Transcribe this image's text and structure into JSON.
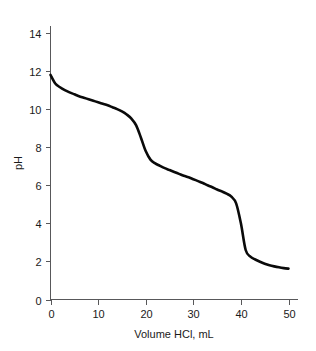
{
  "chart_data": {
    "type": "line",
    "title": "",
    "xlabel": "Volume HCl, mL",
    "ylabel": "pH",
    "xlim": [
      0,
      50
    ],
    "ylim": [
      0,
      14
    ],
    "xticks": [
      0,
      10,
      20,
      30,
      40,
      50
    ],
    "yticks": [
      0,
      2,
      4,
      6,
      8,
      10,
      12,
      14
    ],
    "xtick_labels": [
      "0",
      "10",
      "20",
      "30",
      "40",
      "50"
    ],
    "ytick_labels": [
      "0",
      "2",
      "4",
      "6",
      "8",
      "10",
      "12",
      "14"
    ],
    "grid": false,
    "legend": false,
    "series": [
      {
        "name": "Titration curve",
        "x": [
          0,
          1,
          2,
          3,
          4,
          5,
          6,
          7,
          8,
          9,
          10,
          11,
          12,
          13,
          14,
          15,
          16,
          17,
          18,
          19,
          20,
          21,
          22,
          23,
          24,
          25,
          26,
          27,
          28,
          29,
          30,
          31,
          32,
          33,
          34,
          35,
          36,
          37,
          38,
          39,
          40,
          41,
          42,
          43,
          44,
          45,
          46,
          47,
          48,
          49,
          50
        ],
        "y": [
          11.8,
          11.35,
          11.15,
          11.0,
          10.88,
          10.78,
          10.68,
          10.6,
          10.52,
          10.44,
          10.36,
          10.28,
          10.2,
          10.1,
          10.0,
          9.88,
          9.72,
          9.5,
          9.15,
          8.5,
          7.8,
          7.35,
          7.15,
          7.02,
          6.9,
          6.8,
          6.7,
          6.6,
          6.5,
          6.42,
          6.32,
          6.22,
          6.12,
          6.0,
          5.9,
          5.78,
          5.68,
          5.56,
          5.4,
          5.05,
          4.0,
          2.6,
          2.25,
          2.1,
          1.98,
          1.88,
          1.8,
          1.74,
          1.69,
          1.65,
          1.62
        ]
      }
    ],
    "annotations": [
      {
        "label": "initial pH",
        "x": 0,
        "y": 11.8
      },
      {
        "label": "first equivalence point",
        "x": 20,
        "y": 7.8
      },
      {
        "label": "second equivalence point",
        "x": 40,
        "y": 4.0
      },
      {
        "label": "final pH",
        "x": 50,
        "y": 1.62
      }
    ],
    "colors": {
      "curve": "#0a0a0a",
      "axis": "#58585a",
      "text": "#1a1a1a",
      "background": "#ffffff"
    }
  }
}
